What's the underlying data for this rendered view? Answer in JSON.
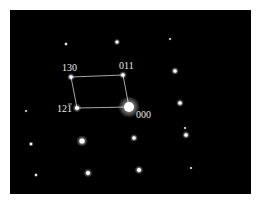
{
  "figure": {
    "type": "selected-area electron diffraction pattern",
    "background": "#000000",
    "spot_color": "#ffffff",
    "index_labels": [
      {
        "id": "130",
        "text": "130",
        "x": 62,
        "y": 71
      },
      {
        "id": "011",
        "text": "011",
        "x": 119,
        "y": 69
      },
      {
        "id": "12-1",
        "text": "121",
        "overbar_last": true,
        "x": 57,
        "y": 112
      },
      {
        "id": "000",
        "text": "000",
        "x": 136,
        "y": 118
      }
    ],
    "unit_cell": [
      [
        71,
        77
      ],
      [
        123,
        75
      ],
      [
        129,
        107
      ],
      [
        77,
        108
      ]
    ],
    "indexed_spots": [
      {
        "name": "130",
        "x": 71,
        "y": 77,
        "r": 1.8
      },
      {
        "name": "011",
        "x": 123,
        "y": 75,
        "r": 1.8
      },
      {
        "name": "12-1",
        "x": 77,
        "y": 108,
        "r": 2
      },
      {
        "name": "000",
        "x": 129,
        "y": 107,
        "r": 5
      }
    ],
    "other_spots": [
      {
        "x": 117,
        "y": 42,
        "r": 1.5
      },
      {
        "x": 66,
        "y": 44,
        "r": 1
      },
      {
        "x": 170,
        "y": 39,
        "r": 0.8
      },
      {
        "x": 175,
        "y": 71,
        "r": 1.8
      },
      {
        "x": 180,
        "y": 103,
        "r": 1.8
      },
      {
        "x": 26,
        "y": 111,
        "r": 0.8
      },
      {
        "x": 31,
        "y": 144,
        "r": 1.2
      },
      {
        "x": 82,
        "y": 141,
        "r": 2.6
      },
      {
        "x": 134,
        "y": 138,
        "r": 1.8
      },
      {
        "x": 186,
        "y": 135,
        "r": 1.8
      },
      {
        "x": 185,
        "y": 128,
        "r": 0.8
      },
      {
        "x": 36,
        "y": 175,
        "r": 1
      },
      {
        "x": 88,
        "y": 173,
        "r": 2
      },
      {
        "x": 139,
        "y": 170,
        "r": 2
      },
      {
        "x": 191,
        "y": 168,
        "r": 0.8
      }
    ]
  }
}
